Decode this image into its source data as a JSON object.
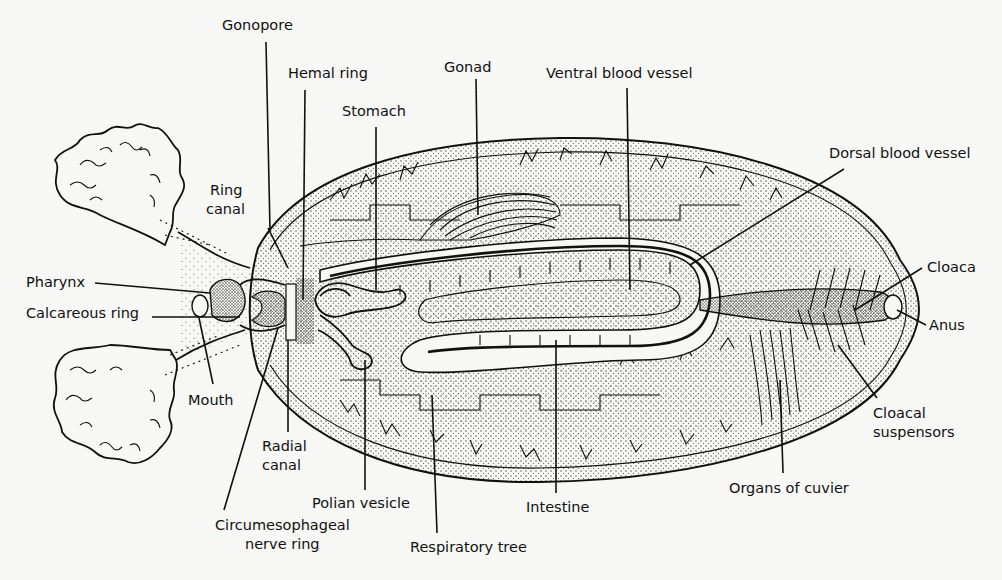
{
  "diagram": {
    "labels": [
      {
        "id": "gonopore",
        "text": "Gonopore",
        "x": 222,
        "y": 30,
        "anchor": "start",
        "line": [
          266,
          42,
          270,
          230
        ]
      },
      {
        "id": "hemal-ring",
        "text": "Hemal ring",
        "x": 288,
        "y": 78,
        "anchor": "start",
        "line": [
          305,
          90,
          303,
          300
        ]
      },
      {
        "id": "stomach",
        "text": "Stomach",
        "x": 342,
        "y": 116,
        "anchor": "start",
        "line": [
          376,
          127,
          376,
          290
        ]
      },
      {
        "id": "gonad",
        "text": "Gonad",
        "x": 444,
        "y": 72,
        "anchor": "start",
        "line": [
          476,
          79,
          478,
          215
        ]
      },
      {
        "id": "ventral-blood-vessel",
        "text": "Ventral blood vessel",
        "x": 546,
        "y": 78,
        "anchor": "start",
        "line": [
          627,
          88,
          630,
          290
        ]
      },
      {
        "id": "dorsal-blood-vessel",
        "text": "Dorsal blood vessel",
        "x": 829,
        "y": 158,
        "anchor": "start",
        "line": [
          844,
          169,
          690,
          265
        ]
      },
      {
        "id": "ring-canal",
        "text": "Ring",
        "text2": "canal",
        "x": 210,
        "y": 195,
        "anchor": "start",
        "line": [
          268,
          228,
          288,
          268
        ]
      },
      {
        "id": "pharynx",
        "text": "Pharynx",
        "x": 26,
        "y": 287,
        "anchor": "start",
        "line": [
          95,
          283,
          210,
          293
        ]
      },
      {
        "id": "calcareous-ring",
        "text": "Calcareous ring",
        "x": 26,
        "y": 318,
        "anchor": "start",
        "line": [
          152,
          317,
          240,
          317
        ]
      },
      {
        "id": "mouth",
        "text": "Mouth",
        "x": 188,
        "y": 405,
        "anchor": "start",
        "line": [
          213,
          384,
          199,
          318
        ]
      },
      {
        "id": "radial-canal",
        "text": "Radial",
        "text2": "canal",
        "x": 262,
        "y": 451,
        "anchor": "start",
        "line": [
          288,
          432,
          288,
          340
        ]
      },
      {
        "id": "circumesophageal-nerve-ring",
        "text": "Circumesophageal",
        "text2": "nerve ring",
        "x": 215,
        "y": 530,
        "anchor": "middle-custom",
        "line": [
          224,
          510,
          278,
          328
        ]
      },
      {
        "id": "polian-vesicle",
        "text": "Polian vesicle",
        "x": 312,
        "y": 508,
        "anchor": "start",
        "line": [
          365,
          490,
          365,
          360
        ]
      },
      {
        "id": "respiratory-tree",
        "text": "Respiratory tree",
        "x": 410,
        "y": 552,
        "anchor": "start",
        "line": [
          437,
          533,
          432,
          395
        ]
      },
      {
        "id": "intestine",
        "text": "Intestine",
        "x": 526,
        "y": 512,
        "anchor": "start",
        "line": [
          556,
          493,
          556,
          340
        ]
      },
      {
        "id": "organs-of-cuvier",
        "text": "Organs of cuvier",
        "x": 729,
        "y": 493,
        "anchor": "start",
        "line": [
          783,
          473,
          780,
          380
        ]
      },
      {
        "id": "cloacal-suspensors",
        "text": "Cloacal",
        "text2": "suspensors",
        "x": 873,
        "y": 418,
        "anchor": "start",
        "line": [
          877,
          398,
          838,
          345
        ]
      },
      {
        "id": "cloaca",
        "text": "Cloaca",
        "x": 927,
        "y": 272,
        "anchor": "start",
        "line": [
          922,
          268,
          855,
          310
        ]
      },
      {
        "id": "anus",
        "text": "Anus",
        "x": 929,
        "y": 330,
        "anchor": "start",
        "line": [
          926,
          325,
          897,
          310
        ]
      }
    ],
    "colors": {
      "ink": "#111111",
      "paper": "#f7f7f5",
      "stipple": "#555555"
    }
  }
}
